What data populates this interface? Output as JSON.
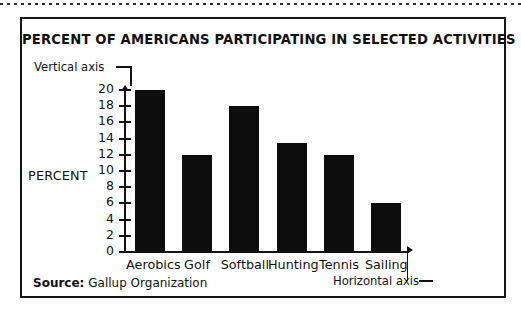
{
  "chart_data": {
    "type": "bar",
    "title": "PERCENT OF AMERICANS PARTICIPATING IN SELECTED ACTIVITIES",
    "categories": [
      "Aerobics",
      "Golf",
      "Softball",
      "Hunting",
      "Tennis",
      "Sailing"
    ],
    "values": [
      20,
      12,
      18,
      13.5,
      12,
      6
    ],
    "xlabel": "",
    "ylabel": "PERCENT",
    "ylim": [
      0,
      20
    ],
    "ytick_step": 2,
    "yticks": [
      0,
      2,
      4,
      6,
      8,
      10,
      12,
      14,
      16,
      18,
      20
    ],
    "ytick_labels": [
      "0",
      "2",
      "4",
      "6",
      "8",
      "10",
      "12",
      "14",
      "16",
      "18",
      "20"
    ],
    "grid": false,
    "legend": null,
    "bar_color": "#0d0d0d",
    "axis_color": "#111111",
    "annotations": [
      {
        "text": "Vertical axis",
        "target": "y-axis"
      },
      {
        "text": "Horizontal axis",
        "target": "x-axis"
      }
    ]
  },
  "figure": {
    "title": "PERCENT OF AMERICANS PARTICIPATING IN SELECTED ACTIVITIES",
    "y_axis_title": "PERCENT",
    "annotation_vertical": "Vertical axis",
    "annotation_horizontal": "Horizontal axis",
    "source_label": "Source:",
    "source_value": "Gallup Organization"
  }
}
